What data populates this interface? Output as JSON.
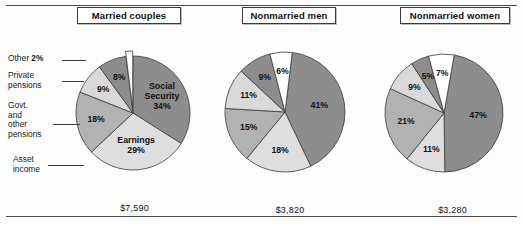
{
  "figure": {
    "top_rule": true,
    "bottom_rule": true,
    "background": "#fdfdfd"
  },
  "palette": {
    "dark_gray": "#8d8d8d",
    "mid_gray": "#b2b2b2",
    "light_gray": "#dedede",
    "pale_gray": "#cfcfcf",
    "white": "#ffffff",
    "outline": "#3a3a3a"
  },
  "callouts": [
    {
      "id": "other",
      "line1": "Other ",
      "value": "2%"
    },
    {
      "id": "private",
      "line1": "Private",
      "line2": "pensions"
    },
    {
      "id": "govt",
      "line1": "Govt.",
      "line2": "and",
      "line3": "other",
      "line4": "pensions"
    },
    {
      "id": "asset",
      "line1": "Asset",
      "line2": "income"
    }
  ],
  "panels": [
    {
      "title": "Married couples",
      "value": "$7,590",
      "slices": [
        {
          "label": "Social\nSecurity\n34%",
          "label_lines": [
            "Social",
            "Security",
            "34%"
          ],
          "percent": 34,
          "color": "#8d8d8d"
        },
        {
          "label": "Earnings\n29%",
          "label_lines": [
            "Earnings",
            "29%"
          ],
          "percent": 29,
          "color": "#dedede"
        },
        {
          "label": "18%",
          "label_lines": [
            "18%"
          ],
          "percent": 18,
          "color": "#b2b2b2"
        },
        {
          "label": "9%",
          "label_lines": [
            "9%"
          ],
          "percent": 9,
          "color": "#d9d9d9"
        },
        {
          "label": "8%",
          "label_lines": [
            "8%"
          ],
          "percent": 8,
          "color": "#8d8d8d"
        },
        {
          "label": "2%",
          "label_lines": [],
          "percent": 2,
          "color": "#ffffff"
        }
      ]
    },
    {
      "title": "Nonmarried men",
      "value": "$3,820",
      "slices": [
        {
          "label": "41%",
          "label_lines": [
            "41%"
          ],
          "percent": 41,
          "color": "#8d8d8d"
        },
        {
          "label": "18%",
          "label_lines": [
            "18%"
          ],
          "percent": 18,
          "color": "#dedede"
        },
        {
          "label": "15%",
          "label_lines": [
            "15%"
          ],
          "percent": 15,
          "color": "#b2b2b2"
        },
        {
          "label": "11%",
          "label_lines": [
            "11%"
          ],
          "percent": 11,
          "color": "#d9d9d9"
        },
        {
          "label": "9%",
          "label_lines": [
            "9%"
          ],
          "percent": 9,
          "color": "#8d8d8d"
        },
        {
          "label": "6%",
          "label_lines": [
            "6%"
          ],
          "percent": 6,
          "color": "#ffffff"
        }
      ]
    },
    {
      "title": "Nonmarried women",
      "value": "$3,280",
      "slices": [
        {
          "label": "47%",
          "label_lines": [
            "47%"
          ],
          "percent": 47,
          "color": "#8d8d8d"
        },
        {
          "label": "11%",
          "label_lines": [
            "11%"
          ],
          "percent": 11,
          "color": "#dedede"
        },
        {
          "label": "21%",
          "label_lines": [
            "21%"
          ],
          "percent": 21,
          "color": "#b2b2b2"
        },
        {
          "label": "9%",
          "label_lines": [
            "9%"
          ],
          "percent": 9,
          "color": "#d9d9d9"
        },
        {
          "label": "5%",
          "label_lines": [
            "5%"
          ],
          "percent": 5,
          "color": "#8d8d8d"
        },
        {
          "label": "7%",
          "label_lines": [
            "7%"
          ],
          "percent": 7,
          "color": "#ffffff"
        }
      ]
    }
  ],
  "chart_data": {
    "type": "pie",
    "title": "",
    "legend_position": "left-callouts",
    "categories": [
      "Social Security",
      "Earnings",
      "Asset income",
      "Govt. and other pensions",
      "Private pensions",
      "Other"
    ],
    "series": [
      {
        "name": "Married couples",
        "values": [
          34,
          29,
          18,
          9,
          8,
          2
        ],
        "total_label": "$7,590"
      },
      {
        "name": "Nonmarried men",
        "values": [
          41,
          18,
          15,
          11,
          9,
          6
        ],
        "total_label": "$3,820"
      },
      {
        "name": "Nonmarried women",
        "values": [
          47,
          11,
          21,
          9,
          5,
          7
        ],
        "total_label": "$3,280"
      }
    ],
    "units": "percent",
    "annotations": [
      "$7,590",
      "$3,820",
      "$3,280"
    ],
    "colors": [
      "#8d8d8d",
      "#dedede",
      "#b2b2b2",
      "#d9d9d9",
      "#8d8d8d",
      "#ffffff"
    ],
    "xlabel": "",
    "ylabel": ""
  }
}
